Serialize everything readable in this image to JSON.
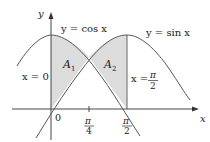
{
  "diagram": {
    "axes": {
      "x_label": "x",
      "y_label": "y",
      "origin_label": "0"
    },
    "curves": [
      {
        "name": "cosine",
        "label": "y = cos x"
      },
      {
        "name": "sine",
        "label": "y = sin x"
      }
    ],
    "vertical_lines": [
      {
        "label_lhs": "x = 0"
      },
      {
        "label_lhs": "x =",
        "label_num": "π",
        "label_den": "2"
      }
    ],
    "regions": [
      {
        "label": "A",
        "sub": "1"
      },
      {
        "label": "A",
        "sub": "2"
      }
    ],
    "ticks": [
      {
        "num": "π",
        "den": "4"
      },
      {
        "num": "π",
        "den": "2"
      }
    ],
    "colors": {
      "shade": "#dcdcdc",
      "curve": "#555555",
      "axis": "#333333"
    }
  }
}
